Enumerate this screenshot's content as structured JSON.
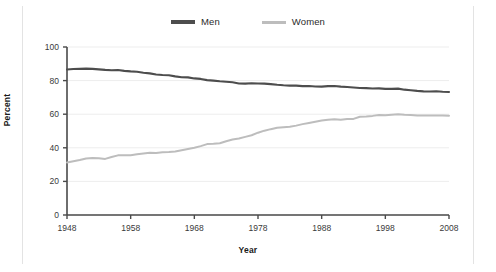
{
  "chart_data": {
    "type": "line",
    "title": "",
    "xlabel": "Year",
    "ylabel": "Percent",
    "xlim": [
      1948,
      2008
    ],
    "ylim": [
      0,
      100
    ],
    "grid": true,
    "legend_position": "top-center",
    "xticks": [
      1948,
      1958,
      1968,
      1978,
      1988,
      1998,
      2008
    ],
    "yticks": [
      0,
      20,
      40,
      60,
      80,
      100
    ],
    "x": [
      1948,
      1949,
      1950,
      1951,
      1952,
      1953,
      1954,
      1955,
      1956,
      1957,
      1958,
      1959,
      1960,
      1961,
      1962,
      1963,
      1964,
      1965,
      1966,
      1967,
      1968,
      1969,
      1970,
      1971,
      1972,
      1973,
      1974,
      1975,
      1976,
      1977,
      1978,
      1979,
      1980,
      1981,
      1982,
      1983,
      1984,
      1985,
      1986,
      1987,
      1988,
      1989,
      1990,
      1991,
      1992,
      1993,
      1994,
      1995,
      1996,
      1997,
      1998,
      1999,
      2000,
      2001,
      2002,
      2003,
      2004,
      2005,
      2006,
      2007,
      2008
    ],
    "series": [
      {
        "name": "Men",
        "color": "#4d4d4d",
        "values": [
          86.6,
          86.9,
          87.0,
          87.1,
          87.0,
          86.7,
          86.4,
          86.2,
          86.3,
          85.8,
          85.5,
          85.3,
          84.7,
          84.3,
          83.6,
          83.3,
          83.2,
          82.5,
          82.0,
          81.9,
          81.3,
          81.0,
          80.3,
          80.0,
          79.6,
          79.3,
          79.0,
          78.3,
          78.2,
          78.4,
          78.3,
          78.2,
          77.9,
          77.5,
          77.2,
          77.0,
          77.0,
          76.7,
          76.8,
          76.5,
          76.4,
          76.7,
          76.8,
          76.4,
          76.2,
          75.9,
          75.6,
          75.5,
          75.3,
          75.4,
          75.1,
          75.1,
          75.2,
          74.6,
          74.3,
          73.9,
          73.6,
          73.5,
          73.7,
          73.4,
          73.2
        ]
      },
      {
        "name": "Women",
        "color": "#bdbdbd",
        "values": [
          31.2,
          32.0,
          32.7,
          33.6,
          33.9,
          33.8,
          33.4,
          34.5,
          35.5,
          35.6,
          35.6,
          36.2,
          36.6,
          37.0,
          36.9,
          37.3,
          37.5,
          37.8,
          38.6,
          39.3,
          40.0,
          41.0,
          42.2,
          42.4,
          42.7,
          43.9,
          44.9,
          45.5,
          46.5,
          47.5,
          49.0,
          50.2,
          51.1,
          51.9,
          52.3,
          52.5,
          53.2,
          54.1,
          54.8,
          55.5,
          56.2,
          56.7,
          57.0,
          56.7,
          57.2,
          57.2,
          58.5,
          58.7,
          59.0,
          59.5,
          59.4,
          59.7,
          59.9,
          59.6,
          59.5,
          59.3,
          59.2,
          59.2,
          59.3,
          59.2,
          59.1
        ]
      }
    ]
  },
  "legend": {
    "items": [
      {
        "label": "Men",
        "marker": "line-swatch-dark"
      },
      {
        "label": "Women",
        "marker": "line-swatch-light"
      }
    ]
  },
  "axes": {
    "x_title": "Year",
    "y_title": "Percent",
    "x_tick_labels": [
      "1948",
      "1958",
      "1968",
      "1978",
      "1988",
      "1998",
      "2008"
    ],
    "y_tick_labels": [
      "0",
      "20",
      "40",
      "60",
      "80",
      "100"
    ]
  },
  "colors": {
    "men": "#4d4d4d",
    "women": "#bdbdbd",
    "axis": "#4a4a4a",
    "grid": "#ededed",
    "frame": "#e3e3e3",
    "background": "#ffffff"
  }
}
